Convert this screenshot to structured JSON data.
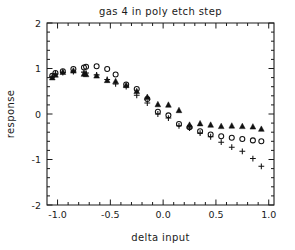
{
  "chart_data": {
    "type": "scatter",
    "title": "gas 4 in poly etch step",
    "xlabel": "delta input",
    "ylabel": "response",
    "xlim": [
      -1.1,
      1.05
    ],
    "ylim": [
      -2,
      2
    ],
    "grid": false,
    "legend": "none",
    "xticks": [
      -1.0,
      -0.5,
      0.0,
      0.5,
      1.0
    ],
    "xticklabels": [
      "-1.0",
      "-0.5",
      "0.0",
      "0.5",
      "1.0"
    ],
    "yticks": [
      -2,
      -1,
      0,
      1,
      2
    ],
    "yticklabels": [
      "-2",
      "-1",
      "0",
      "1",
      "2"
    ],
    "x": [
      -1.05,
      -1.02,
      -0.95,
      -0.85,
      -0.75,
      -0.73,
      -0.63,
      -0.53,
      -0.45,
      -0.35,
      -0.25,
      -0.15,
      -0.05,
      0.05,
      0.15,
      0.25,
      0.35,
      0.45,
      0.55,
      0.65,
      0.75,
      0.85,
      0.93
    ],
    "series": [
      {
        "name": "triangle-series",
        "marker": "triangle",
        "values": [
          0.8,
          0.86,
          0.92,
          0.95,
          0.88,
          0.87,
          0.84,
          0.74,
          0.72,
          0.63,
          0.5,
          0.37,
          0.21,
          0.2,
          0.08,
          -0.24,
          -0.21,
          -0.24,
          -0.27,
          -0.26,
          -0.27,
          -0.28,
          -0.33
        ]
      },
      {
        "name": "circle-series",
        "marker": "circle",
        "values": [
          0.84,
          0.9,
          0.94,
          0.99,
          1.02,
          1.04,
          1.05,
          0.99,
          0.87,
          0.65,
          0.55,
          0.33,
          0.05,
          -0.03,
          -0.22,
          -0.29,
          -0.38,
          -0.45,
          -0.49,
          -0.52,
          -0.55,
          -0.58,
          -0.6
        ]
      },
      {
        "name": "plus-series",
        "marker": "plus",
        "values": [
          0.82,
          0.88,
          0.91,
          0.93,
          0.92,
          0.9,
          0.86,
          0.76,
          0.66,
          0.6,
          0.41,
          0.24,
          0.0,
          -0.09,
          -0.26,
          -0.31,
          -0.42,
          -0.5,
          -0.62,
          -0.73,
          -0.82,
          -0.98,
          -1.15
        ]
      }
    ]
  }
}
